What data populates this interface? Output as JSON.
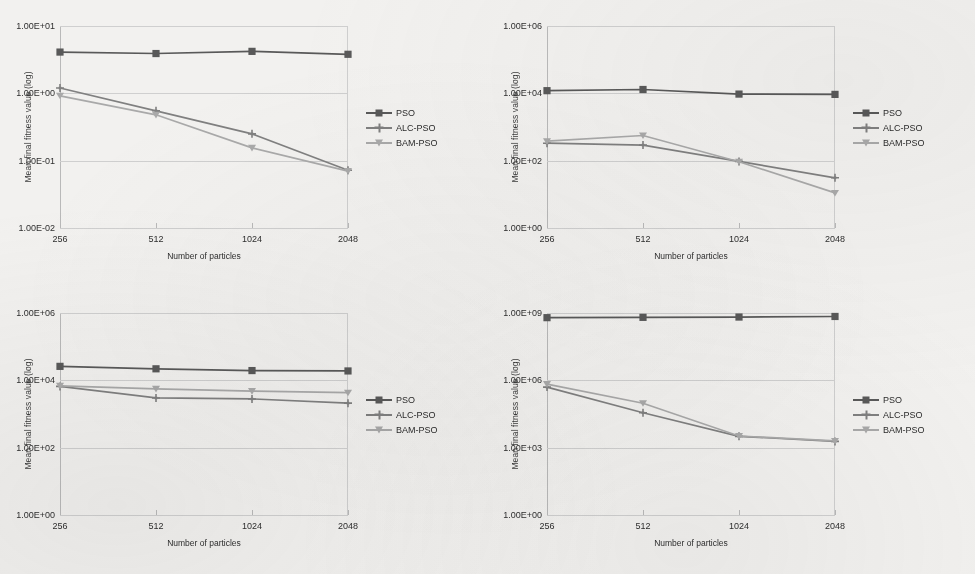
{
  "figure": {
    "background_color": "#f2f1ef",
    "panel_count": 4,
    "series_colors": {
      "PSO": "#595959",
      "ALC-PSO": "#808080",
      "BAM-PSO": "#a9a9a9"
    },
    "markers": {
      "PSO": "filled-square",
      "ALC-PSO": "plus",
      "BAM-PSO": "down-triangle"
    }
  },
  "legend": {
    "entries": [
      {
        "label": "PSO",
        "color": "#595959",
        "marker": "square"
      },
      {
        "label": "ALC-PSO",
        "color": "#808080",
        "marker": "plus"
      },
      {
        "label": "BAM-PSO",
        "color": "#a9a9a9",
        "marker": "triangle"
      }
    ]
  },
  "chart_data": [
    {
      "type": "line",
      "id": "panel-top-left",
      "title": "",
      "xlabel": "Number of particles",
      "ylabel": "Mean final fitness value (log)",
      "yscale": "log",
      "ylim": [
        0.01,
        10
      ],
      "ytick_labels": [
        "1.00E+01",
        "1.00E+00",
        "1.00E-01",
        "1.00E-02"
      ],
      "ytick_values": [
        10,
        1,
        0.1,
        0.01
      ],
      "grid": true,
      "legend_position": "right",
      "categories": [
        "256",
        "512",
        "1024",
        "2048"
      ],
      "series": [
        {
          "name": "PSO",
          "values": [
            4.1,
            3.9,
            4.2,
            3.8
          ]
        },
        {
          "name": "ALC-PSO",
          "values": [
            1.2,
            0.55,
            0.25,
            0.072
          ]
        },
        {
          "name": "BAM-PSO",
          "values": [
            0.92,
            0.48,
            0.155,
            0.07
          ]
        }
      ]
    },
    {
      "type": "line",
      "id": "panel-top-right",
      "title": "",
      "xlabel": "Number of particles",
      "ylabel": "Mean final fitness value (log)",
      "yscale": "log",
      "ylim": [
        1,
        1000000
      ],
      "ytick_labels": [
        "1.00E+06",
        "1.00E+04",
        "1.00E+02",
        "1.00E+00"
      ],
      "ytick_values": [
        1000000,
        10000,
        100,
        1
      ],
      "grid": true,
      "legend_position": "right",
      "categories": [
        "256",
        "512",
        "1024",
        "2048"
      ],
      "series": [
        {
          "name": "PSO",
          "values": [
            12000,
            13000,
            9500,
            9300
          ]
        },
        {
          "name": "ALC-PSO",
          "values": [
            330,
            290,
            95,
            31
          ]
        },
        {
          "name": "BAM-PSO",
          "values": [
            380,
            560,
            93,
            11
          ]
        }
      ]
    },
    {
      "type": "line",
      "id": "panel-bottom-left",
      "title": "",
      "xlabel": "Number of particles",
      "ylabel": "Mean final fitness value (log)",
      "yscale": "log",
      "ylim": [
        1,
        1000000
      ],
      "ytick_labels": [
        "1.00E+06",
        "1.00E+04",
        "1.00E+02",
        "1.00E+00"
      ],
      "ytick_values": [
        1000000,
        10000,
        100,
        1
      ],
      "grid": true,
      "legend_position": "right",
      "categories": [
        "256",
        "512",
        "1024",
        "2048"
      ],
      "series": [
        {
          "name": "PSO",
          "values": [
            26000,
            22000,
            19500,
            19000
          ]
        },
        {
          "name": "ALC-PSO",
          "values": [
            6600,
            3000,
            2800,
            2100
          ]
        },
        {
          "name": "BAM-PSO",
          "values": [
            6900,
            5600,
            4800,
            4300
          ]
        }
      ]
    },
    {
      "type": "line",
      "id": "panel-bottom-right",
      "title": "",
      "xlabel": "Number of particles",
      "ylabel": "Mean final fitness value (log)",
      "yscale": "log",
      "ylim": [
        1,
        1000000000
      ],
      "ytick_labels": [
        "1.00E+09",
        "1.00E+06",
        "1.00E+03",
        "1.00E+00"
      ],
      "ytick_values": [
        1000000000,
        1000000,
        1000,
        1
      ],
      "grid": true,
      "legend_position": "right",
      "categories": [
        "256",
        "512",
        "1024",
        "2048"
      ],
      "series": [
        {
          "name": "PSO",
          "values": [
            620000000,
            640000000,
            660000000,
            700000000
          ]
        },
        {
          "name": "ALC-PSO",
          "values": [
            500000,
            36000,
            3200,
            1900
          ]
        },
        {
          "name": "BAM-PSO",
          "values": [
            680000,
            96000,
            3300,
            2000
          ]
        }
      ]
    }
  ]
}
